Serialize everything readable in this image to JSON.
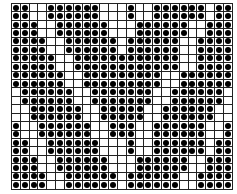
{
  "grid": {
    "columns": 25,
    "rows": 22,
    "dot_color": "#000000",
    "line_color": "#222222",
    "pattern": [
      "1100111111000100111111011",
      "1100111111000100111111011",
      "1110011111100011111100111",
      "1110011111100011111100111",
      "1111001111110111111001111",
      "1111001111110111111001111",
      "1111100111111111111001111",
      "1111100111111111111001111",
      "1111110011111111100111111",
      "1111110011111111100111111",
      "0111111001111111001111110",
      "0111111001111111001111110",
      "0011111100111110011111100",
      "0011111100111110011111100",
      "1001111110011100111111001",
      "1001111110011100111111001",
      "1100111111000100111111011",
      "1100111111000100111111011",
      "1110011111100011111100111",
      "1110011111100011111100111",
      "1111001111110111111001111",
      "1111001111110111111001111"
    ]
  }
}
